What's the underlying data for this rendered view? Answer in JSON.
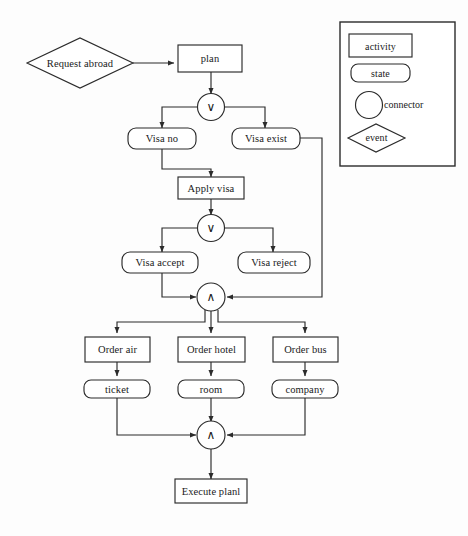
{
  "diagram": {
    "stroke_color": "#2b2b2b",
    "fill_color": "#ffffff",
    "background": "#fdfdfd",
    "nodes": {
      "request_abroad": {
        "label": "Request abroad",
        "shape": "event-diamond"
      },
      "plan": {
        "label": "plan",
        "shape": "activity-rect"
      },
      "or_split_1": {
        "label": "∨",
        "shape": "connector-circle"
      },
      "visa_no": {
        "label": "Visa no",
        "shape": "state-rounded"
      },
      "visa_exist": {
        "label": "Visa exist",
        "shape": "state-rounded"
      },
      "apply_visa": {
        "label": "Apply visa",
        "shape": "activity-rect"
      },
      "or_split_2": {
        "label": "∨",
        "shape": "connector-circle"
      },
      "visa_accept": {
        "label": "Visa accept",
        "shape": "state-rounded"
      },
      "visa_reject": {
        "label": "Visa reject",
        "shape": "state-rounded"
      },
      "and_join_1": {
        "label": "∧",
        "shape": "connector-circle"
      },
      "order_air": {
        "label": "Order air",
        "shape": "activity-rect"
      },
      "order_hotel": {
        "label": "Order hotel",
        "shape": "activity-rect"
      },
      "order_bus": {
        "label": "Order bus",
        "shape": "activity-rect"
      },
      "ticket": {
        "label": "ticket",
        "shape": "state-rounded"
      },
      "room": {
        "label": "room",
        "shape": "state-rounded"
      },
      "company": {
        "label": "company",
        "shape": "state-rounded"
      },
      "and_join_2": {
        "label": "∧",
        "shape": "connector-circle"
      },
      "execute_plan": {
        "label": "Execute planl",
        "shape": "activity-rect"
      }
    }
  },
  "legend": {
    "items": [
      {
        "label": "activity",
        "shape": "rectangle",
        "label_position": "inside"
      },
      {
        "label": "state",
        "shape": "rounded-rectangle",
        "label_position": "inside"
      },
      {
        "label": "connector",
        "shape": "circle",
        "label_position": "right"
      },
      {
        "label": "event",
        "shape": "diamond",
        "label_position": "inside"
      }
    ]
  }
}
